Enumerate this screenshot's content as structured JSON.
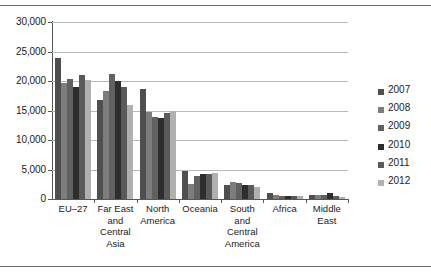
{
  "chart_data": {
    "type": "bar",
    "title": "",
    "subtitle": "",
    "xlabel": "",
    "ylabel": "",
    "ylim": [
      0,
      30000
    ],
    "ytick_values": [
      0,
      5000,
      10000,
      15000,
      20000,
      25000,
      30000
    ],
    "ytick_labels": [
      "0",
      "5,000",
      "10,000",
      "15,000",
      "20,000",
      "25,000",
      "30,000"
    ],
    "grid": true,
    "grid_axis": "y",
    "legend_position": "right",
    "orientation": "vertical",
    "grouping": "clustered",
    "categories": [
      "EU–27",
      "Far East and Central Asia",
      "North America",
      "Oceania",
      "South and Central America",
      "Africa",
      "Middle East"
    ],
    "category_label_lines": [
      [
        "EU–27"
      ],
      [
        "Far East",
        "and",
        "Central",
        "Asia"
      ],
      [
        "North",
        "America"
      ],
      [
        "Oceania"
      ],
      [
        "South",
        "and",
        "Central",
        "America"
      ],
      [
        "Africa"
      ],
      [
        "Middle",
        "East"
      ]
    ],
    "series": [
      {
        "name": "2007",
        "color": "#4f4f4f",
        "values": [
          23950,
          16700,
          18700,
          4700,
          2400,
          1100,
          600
        ]
      },
      {
        "name": "2008",
        "color": "#7d7d7d",
        "values": [
          19650,
          18300,
          14700,
          2600,
          2900,
          600,
          650
        ]
      },
      {
        "name": "2009",
        "color": "#616161",
        "values": [
          20400,
          21200,
          13900,
          3900,
          2700,
          450,
          700
        ]
      },
      {
        "name": "2010",
        "color": "#2d2d2d",
        "values": [
          18950,
          20050,
          13700,
          4300,
          2400,
          500,
          1000
        ]
      },
      {
        "name": "2011",
        "color": "#5a5a5a",
        "values": [
          20950,
          19050,
          14500,
          4200,
          2300,
          500,
          550
        ]
      },
      {
        "name": "2012",
        "color": "#b0b0b0",
        "values": [
          20200,
          16000,
          15000,
          4400,
          2100,
          550,
          400
        ]
      }
    ]
  },
  "legend": {
    "entries": [
      "2007",
      "2008",
      "2009",
      "2010",
      "2011",
      "2012"
    ]
  },
  "colors": {
    "axis": "#575757",
    "gridline": "#b9b9b9",
    "text": "#1b1b1b",
    "background": "#ffffff",
    "rule": "#6a6a6a"
  }
}
